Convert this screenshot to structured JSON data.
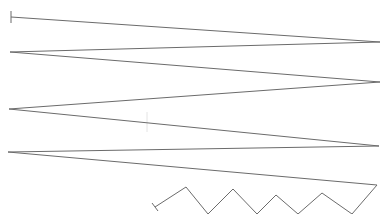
{
  "canvas": {
    "width": 386,
    "height": 214,
    "background": "#ffffff",
    "stroke_color": "#6b6b6b",
    "stroke_width": 1
  },
  "main_polyline": {
    "points": [
      [
        11,
        17
      ],
      [
        380,
        42
      ],
      [
        10,
        52
      ],
      [
        380,
        82
      ],
      [
        9,
        109
      ],
      [
        379,
        146
      ],
      [
        8,
        152
      ],
      [
        377,
        185
      ],
      [
        352,
        214
      ],
      [
        322,
        193
      ],
      [
        298,
        214
      ],
      [
        276,
        195
      ],
      [
        257,
        214
      ],
      [
        233,
        189
      ],
      [
        208,
        214
      ],
      [
        186,
        187
      ],
      [
        155,
        207
      ]
    ]
  },
  "start_tick": {
    "x1": 11,
    "y1": 11,
    "x2": 11,
    "y2": 23
  },
  "end_tick": {
    "x1": 152,
    "y1": 203,
    "x2": 158,
    "y2": 211
  },
  "faint_mark": {
    "x1": 147,
    "y1": 112,
    "x2": 147,
    "y2": 132,
    "color": "#e4e4e4"
  }
}
